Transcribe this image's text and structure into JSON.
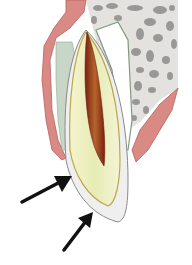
{
  "figure": {
    "width": 192,
    "height": 265,
    "parts": [
      {
        "name": "gingiva",
        "color": "#d98a84"
      },
      {
        "name": "alveolar-bone",
        "color": "#e4e2df",
        "pattern_color": "#9a9896"
      },
      {
        "name": "periodontal-ligament",
        "color": "#c7d6c6"
      },
      {
        "name": "dentin",
        "color": "#eef0c4"
      },
      {
        "name": "enamel-layer",
        "color": "#efefef"
      },
      {
        "name": "pulp",
        "color": "#8a2a14"
      },
      {
        "name": "cementum-line",
        "color": "#b9a848"
      }
    ],
    "arrows": [
      {
        "name": "upper-arrow",
        "from": [
          22,
          202
        ],
        "to": [
          70,
          178
        ],
        "color": "#111111"
      },
      {
        "name": "lower-arrow",
        "from": [
          64,
          250
        ],
        "to": [
          92,
          213
        ],
        "color": "#111111"
      }
    ]
  }
}
